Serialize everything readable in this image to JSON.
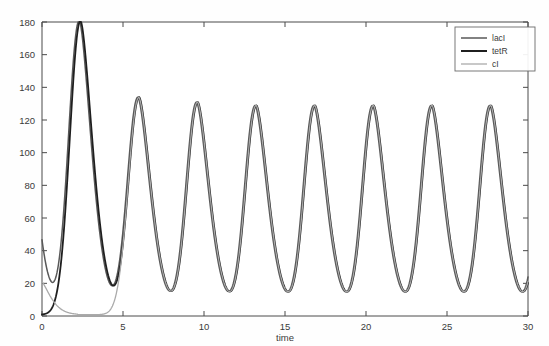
{
  "chart_data": {
    "type": "line",
    "title": "",
    "xlabel": "time",
    "ylabel": "",
    "xlim": [
      0,
      30
    ],
    "ylim": [
      0,
      180
    ],
    "xticks": [
      0,
      5,
      10,
      15,
      20,
      25,
      30
    ],
    "xtick_labels": [
      "0",
      "5",
      "10",
      "15",
      "20",
      "25",
      "30"
    ],
    "yticks": [
      0,
      20,
      40,
      60,
      80,
      100,
      120,
      140,
      160,
      180
    ],
    "ytick_labels": [
      "0",
      "20",
      "40",
      "60",
      "80",
      "100",
      "120",
      "140",
      "160",
      "180"
    ],
    "grid": false,
    "legend_position": "upper right",
    "legend_entries": [
      "lacI",
      "tetR",
      "cI"
    ],
    "series": [
      {
        "name": "lacI",
        "color": "#595959",
        "linewidth": 1.5,
        "peak_times": [
          6.0,
          13.2,
          20.4,
          27.4
        ],
        "peak_values": [
          148,
          133,
          130,
          129
        ],
        "initial_value": 0
      },
      {
        "name": "tetR",
        "color": "#1f1f1f",
        "linewidth": 1.8,
        "peak_times": [
          2.3,
          9.6,
          16.8,
          23.9
        ],
        "peak_values": [
          180,
          137,
          131,
          130
        ],
        "initial_value": 0
      },
      {
        "name": "cI",
        "color": "#aaaaaa",
        "linewidth": 1.3,
        "peak_times": [
          0.6,
          6.0,
          13.2,
          20.4,
          27.4
        ],
        "peak_values": [
          31,
          0,
          0,
          0,
          0
        ],
        "initial_value": 20
      }
    ],
    "oscillation": {
      "period": 3.62,
      "phase_offsets": [
        2.3,
        6.0,
        9.6
      ],
      "amplitudes": [
        180,
        148,
        137,
        133,
        131,
        130,
        130,
        129,
        128
      ],
      "peak_order": [
        "tetR",
        "lacI",
        "cI",
        "tetR",
        "lacI",
        "cI",
        "tetR",
        "lacI",
        "cI"
      ],
      "baseline": 0.8,
      "peak_sharpness": 3.6
    }
  },
  "axes": {
    "xlabel": "time"
  },
  "legend": {
    "items": [
      {
        "label": "lacI",
        "color": "#595959",
        "width": 1.5
      },
      {
        "label": "tetR",
        "color": "#1f1f1f",
        "width": 2.0
      },
      {
        "label": "cI",
        "color": "#aaaaaa",
        "width": 1.3
      }
    ]
  },
  "colors": {
    "axis": "#4a4a4a",
    "text": "#3a3a3a",
    "background": "#fefefe",
    "legend_border": "#6a6a6a"
  }
}
